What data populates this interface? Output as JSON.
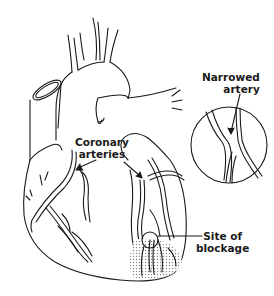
{
  "diagram": {
    "colors": {
      "line": "#1a1a1a",
      "background": "#ffffff",
      "shading": "#b0b0b0"
    },
    "labels": {
      "narrowed_artery": {
        "line1": "Narrowed",
        "line2": "artery"
      },
      "coronary_arteries": {
        "line1": "Coronary",
        "line2": "arteries"
      },
      "site_of_blockage": {
        "line1": "Site of",
        "line2": "blockage"
      }
    },
    "elements": [
      "heart-outline",
      "aorta",
      "superior-vena-cava",
      "pulmonary-artery",
      "coronary-arteries",
      "magnified-inset-narrowed-artery",
      "blockage-circle",
      "damaged-tissue-shading"
    ]
  }
}
